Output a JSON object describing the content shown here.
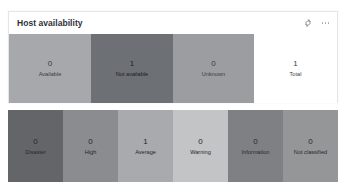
{
  "widget": {
    "title": "Host availability",
    "header_icons": [
      {
        "name": "gear-icon",
        "glyph": "gear"
      },
      {
        "name": "more-options-icon",
        "glyph": "ellipsis-horizontal"
      }
    ]
  },
  "availability": {
    "cells": [
      {
        "value": "0",
        "label": "Available",
        "color": "#a6a8ab",
        "width_px": 82,
        "dark": false
      },
      {
        "value": "1",
        "label": "Not available",
        "color": "#6d7074",
        "width_px": 82,
        "dark": true
      },
      {
        "value": "0",
        "label": "Unknown",
        "color": "#9b9da0",
        "width_px": 81,
        "dark": false
      },
      {
        "value": "1",
        "label": "Total",
        "color": "#ffffff",
        "width_px": 83,
        "dark": false
      }
    ]
  },
  "severity": {
    "cells": [
      {
        "value": "0",
        "label": "Disaster",
        "color": "#636569"
      },
      {
        "value": "0",
        "label": "High",
        "color": "#8a8c8f"
      },
      {
        "value": "1",
        "label": "Average",
        "color": "#a8aaad"
      },
      {
        "value": "0",
        "label": "Warning",
        "color": "#c2c4c6"
      },
      {
        "value": "0",
        "label": "Information",
        "color": "#7e8084"
      },
      {
        "value": "0",
        "label": "Not classified",
        "color": "#949698"
      }
    ]
  },
  "theme": {
    "card_background": "#ffffff",
    "card_border": "#e3e5e8",
    "title_color": "#2e3136",
    "icon_color": "#9fa3a8",
    "page_background": "#ffffff"
  }
}
